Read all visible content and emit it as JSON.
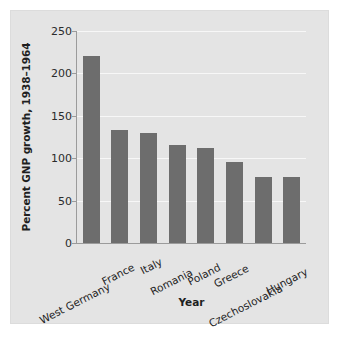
{
  "chart_data": {
    "type": "bar",
    "title": "",
    "xlabel": "Year",
    "ylabel": "Percent GNP growth, 1938–1964",
    "categories": [
      "West Germany",
      "France",
      "Italy",
      "Romania",
      "Poland",
      "Greece",
      "Czechoslovakia",
      "Hungary"
    ],
    "values": [
      220,
      133,
      130,
      116,
      112,
      96,
      78,
      78
    ],
    "ylim": [
      0,
      250
    ],
    "yticks": [
      0,
      50,
      100,
      150,
      200,
      250
    ],
    "ytick_labels": [
      "0",
      "50",
      "100",
      "150",
      "200",
      "250"
    ],
    "grid": "horizontal",
    "legend": "none",
    "bar_color": "#6d6d6d",
    "plot_background": "#e4e4e4",
    "gridline_color": "#f7f7f7",
    "figure_background": "#ffffff"
  },
  "figure": {
    "x_axis_title": "Year",
    "y_axis_title": "Percent GNP growth, 1938–1964"
  }
}
